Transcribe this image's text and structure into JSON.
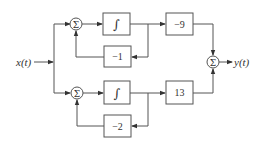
{
  "diagram": {
    "input_label": "x(t)",
    "output_label": "y(t)",
    "summer_symbol": "Σ",
    "integrator_symbol": "∫",
    "top_branch": {
      "feedback_gain": "−1",
      "output_gain": "−9"
    },
    "bottom_branch": {
      "feedback_gain": "−2",
      "output_gain": "13"
    },
    "colors": {
      "stroke": "#555555",
      "text": "#333333",
      "background": "#ffffff"
    }
  }
}
